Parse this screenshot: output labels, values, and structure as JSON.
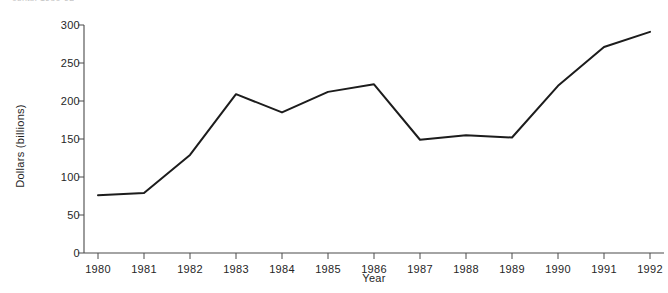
{
  "top_caption": "cents, 1980-92",
  "chart_data": {
    "type": "line",
    "title": "",
    "xlabel": "Year",
    "ylabel": "Dollars (billions)",
    "x": [
      1980,
      1981,
      1982,
      1983,
      1984,
      1985,
      1986,
      1987,
      1988,
      1989,
      1990,
      1991,
      1992
    ],
    "categories": [
      "1980",
      "1981",
      "1982",
      "1983",
      "1984",
      "1985",
      "1986",
      "1987",
      "1988",
      "1989",
      "1990",
      "1991",
      "1992"
    ],
    "values": [
      76,
      79,
      129,
      209,
      185,
      212,
      222,
      149,
      155,
      152,
      220,
      271,
      291
    ],
    "series": [
      {
        "name": "Dollars (billions)",
        "values": [
          76,
          79,
          129,
          209,
          185,
          212,
          222,
          149,
          155,
          152,
          220,
          271,
          291
        ],
        "color": "#1c1c1c"
      }
    ],
    "ylim": [
      0,
      300
    ],
    "yticks": [
      0,
      50,
      100,
      150,
      200,
      250,
      300
    ],
    "ytick_labels": [
      "0",
      "50",
      "100",
      "150",
      "200",
      "250",
      "300"
    ],
    "xtick_labels": [
      "1980",
      "1981",
      "1982",
      "1983",
      "1984",
      "1985",
      "1986",
      "1987",
      "1988",
      "1989",
      "1990",
      "1991",
      "1992"
    ],
    "grid": false,
    "legend": false,
    "legend_position": "none",
    "axis_color": "#4a4a4a",
    "background_color": "#ffffff"
  }
}
